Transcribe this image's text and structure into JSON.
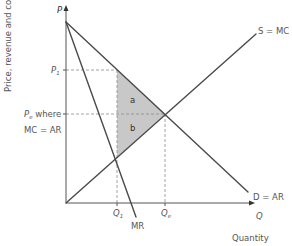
{
  "diagram": {
    "type": "economics-welfare-loss",
    "y_axis": {
      "title": "Price, revenue and cost",
      "symbol": "P"
    },
    "x_axis": {
      "title": "Quantity",
      "symbol": "Q"
    },
    "curves": {
      "demand": "D = AR",
      "supply": "S = MC",
      "marginal_revenue": "MR"
    },
    "price_labels": {
      "p1": "P",
      "p1_sub": "1",
      "pe": "P",
      "pe_sub": "e",
      "pe_suffix": " where",
      "pe_line2": "MC = AR"
    },
    "quantity_labels": {
      "q1": "Q",
      "q1_sub": "1",
      "qe": "Q",
      "qe_sub": "e"
    },
    "regions": {
      "a": "a",
      "b": "b"
    },
    "colors": {
      "line": "#4a4a4a",
      "shade": "#c8c8c8",
      "dash": "#888888",
      "text": "#555555"
    }
  }
}
